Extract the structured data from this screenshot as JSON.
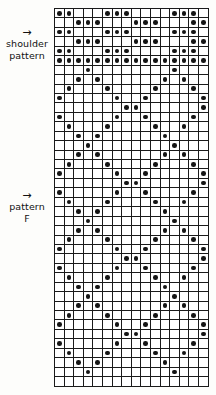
{
  "page": {
    "kind": "knitting-pattern-chart",
    "background_color": "#fdfdfb",
    "ink_color": "#141414"
  },
  "labels": [
    {
      "id": "shoulder",
      "arrow": "→",
      "line1": "shoulder",
      "line2": "pattern"
    },
    {
      "id": "pattern-f",
      "arrow": "→",
      "line1": "pattern",
      "line2": "F"
    }
  ],
  "chart_data": {
    "type": "heatmap",
    "title": "",
    "xlabel": "",
    "ylabel": "",
    "columns": 16,
    "rows": 40,
    "cell_symbols": {
      "0": "empty",
      "1": "dot"
    },
    "legend": [
      {
        "symbol": "dot",
        "meaning": "filled stitch"
      },
      {
        "symbol": "empty",
        "meaning": "background stitch"
      }
    ],
    "grid": [
      [
        1,
        1,
        0,
        0,
        0,
        1,
        1,
        1,
        0,
        0,
        0,
        0,
        1,
        1,
        1,
        0
      ],
      [
        0,
        0,
        1,
        1,
        1,
        0,
        0,
        0,
        1,
        1,
        1,
        0,
        0,
        0,
        1,
        1
      ],
      [
        1,
        1,
        0,
        0,
        0,
        1,
        1,
        1,
        0,
        0,
        0,
        0,
        1,
        1,
        1,
        0
      ],
      [
        0,
        0,
        1,
        1,
        1,
        0,
        0,
        0,
        1,
        1,
        1,
        0,
        0,
        0,
        1,
        1
      ],
      [
        1,
        1,
        0,
        0,
        0,
        1,
        1,
        1,
        0,
        0,
        0,
        0,
        1,
        1,
        1,
        0
      ],
      [
        1,
        1,
        1,
        1,
        1,
        1,
        1,
        1,
        1,
        1,
        1,
        1,
        1,
        1,
        1,
        1
      ],
      [
        0,
        0,
        0,
        1,
        0,
        0,
        0,
        0,
        0,
        0,
        0,
        0,
        1,
        0,
        0,
        0
      ],
      [
        0,
        0,
        1,
        0,
        1,
        0,
        0,
        0,
        0,
        0,
        0,
        1,
        0,
        1,
        0,
        0
      ],
      [
        0,
        1,
        0,
        0,
        0,
        1,
        0,
        0,
        0,
        0,
        1,
        0,
        0,
        0,
        1,
        0
      ],
      [
        1,
        0,
        0,
        0,
        0,
        0,
        1,
        0,
        0,
        1,
        0,
        0,
        0,
        0,
        0,
        1
      ],
      [
        0,
        0,
        0,
        0,
        0,
        0,
        0,
        1,
        1,
        0,
        0,
        0,
        0,
        0,
        0,
        1
      ],
      [
        1,
        0,
        0,
        0,
        0,
        0,
        1,
        0,
        0,
        1,
        0,
        0,
        0,
        0,
        1,
        0
      ],
      [
        0,
        1,
        0,
        0,
        0,
        1,
        0,
        0,
        0,
        0,
        1,
        0,
        0,
        1,
        0,
        0
      ],
      [
        0,
        0,
        1,
        0,
        1,
        0,
        0,
        0,
        0,
        0,
        0,
        1,
        0,
        0,
        0,
        0
      ],
      [
        0,
        0,
        0,
        1,
        0,
        0,
        0,
        0,
        0,
        0,
        0,
        0,
        1,
        0,
        0,
        0
      ],
      [
        0,
        0,
        1,
        0,
        1,
        0,
        0,
        0,
        0,
        0,
        0,
        1,
        0,
        1,
        0,
        0
      ],
      [
        0,
        1,
        0,
        0,
        0,
        1,
        0,
        0,
        0,
        0,
        1,
        0,
        0,
        0,
        1,
        0
      ],
      [
        1,
        0,
        0,
        0,
        0,
        0,
        1,
        0,
        0,
        1,
        0,
        0,
        0,
        0,
        0,
        1
      ],
      [
        0,
        0,
        0,
        0,
        0,
        0,
        0,
        1,
        1,
        0,
        0,
        0,
        0,
        0,
        0,
        1
      ],
      [
        1,
        0,
        0,
        0,
        0,
        0,
        1,
        0,
        0,
        1,
        0,
        0,
        0,
        0,
        1,
        0
      ],
      [
        0,
        1,
        0,
        0,
        0,
        1,
        0,
        0,
        0,
        0,
        1,
        0,
        0,
        1,
        0,
        0
      ],
      [
        0,
        0,
        1,
        0,
        1,
        0,
        0,
        0,
        0,
        0,
        0,
        1,
        0,
        0,
        0,
        0
      ],
      [
        0,
        0,
        0,
        1,
        0,
        0,
        0,
        0,
        0,
        0,
        0,
        0,
        1,
        0,
        0,
        0
      ],
      [
        0,
        0,
        1,
        0,
        1,
        0,
        0,
        0,
        0,
        0,
        0,
        1,
        0,
        1,
        0,
        0
      ],
      [
        0,
        1,
        0,
        0,
        0,
        1,
        0,
        0,
        0,
        0,
        1,
        0,
        0,
        0,
        1,
        0
      ],
      [
        1,
        0,
        0,
        0,
        0,
        0,
        1,
        0,
        0,
        1,
        0,
        0,
        0,
        0,
        0,
        1
      ],
      [
        0,
        0,
        0,
        0,
        0,
        0,
        0,
        1,
        1,
        0,
        0,
        0,
        0,
        0,
        0,
        1
      ],
      [
        1,
        0,
        0,
        0,
        0,
        0,
        1,
        0,
        0,
        1,
        0,
        0,
        0,
        0,
        1,
        0
      ],
      [
        0,
        1,
        0,
        0,
        0,
        1,
        0,
        0,
        0,
        0,
        1,
        0,
        0,
        1,
        0,
        0
      ],
      [
        0,
        0,
        1,
        0,
        1,
        0,
        0,
        0,
        0,
        0,
        0,
        1,
        0,
        0,
        0,
        0
      ],
      [
        0,
        0,
        0,
        1,
        0,
        0,
        0,
        0,
        0,
        0,
        0,
        0,
        1,
        0,
        0,
        0
      ],
      [
        0,
        0,
        1,
        0,
        1,
        0,
        0,
        0,
        0,
        0,
        0,
        1,
        0,
        1,
        0,
        0
      ],
      [
        0,
        1,
        0,
        0,
        0,
        1,
        0,
        0,
        0,
        0,
        1,
        0,
        0,
        0,
        1,
        0
      ],
      [
        1,
        0,
        0,
        0,
        0,
        0,
        1,
        0,
        0,
        1,
        0,
        0,
        0,
        0,
        0,
        1
      ],
      [
        0,
        0,
        0,
        0,
        0,
        0,
        0,
        1,
        1,
        0,
        0,
        0,
        0,
        0,
        0,
        1
      ],
      [
        1,
        0,
        0,
        0,
        0,
        0,
        1,
        0,
        0,
        1,
        0,
        0,
        0,
        0,
        1,
        0
      ],
      [
        0,
        1,
        0,
        0,
        0,
        1,
        0,
        0,
        0,
        0,
        1,
        0,
        0,
        1,
        0,
        0
      ],
      [
        0,
        0,
        1,
        0,
        1,
        0,
        0,
        0,
        0,
        0,
        0,
        1,
        0,
        0,
        0,
        0
      ],
      [
        0,
        0,
        0,
        1,
        0,
        0,
        0,
        0,
        0,
        0,
        0,
        0,
        1,
        0,
        0,
        0
      ],
      [
        0,
        0,
        0,
        0,
        0,
        0,
        0,
        0,
        0,
        0,
        0,
        0,
        0,
        0,
        0,
        0
      ]
    ]
  }
}
